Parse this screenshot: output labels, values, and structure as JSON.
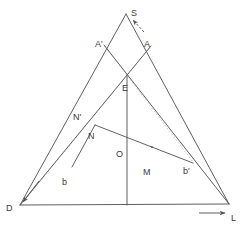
{
  "figure": {
    "title": "",
    "type": "geometric-construction-diagram",
    "background_color": "#ffffff",
    "stroke_color": "#555555",
    "faint_stroke_color": "#bdbdbd",
    "label_color": "#3a3a3a",
    "points": {
      "S": {
        "label": "S",
        "x": 126,
        "y": 13,
        "label_x": 131,
        "label_y": 13
      },
      "A": {
        "label": "A",
        "x": 151,
        "y": 46,
        "label_x": 146,
        "label_y": 44
      },
      "A_prime": {
        "label": "A'",
        "x": 104,
        "y": 45,
        "label_x": 97,
        "label_y": 44
      },
      "E": {
        "label": "E",
        "x": 127,
        "y": 74,
        "label_x": 124,
        "label_y": 88
      },
      "N_prime": {
        "label": "N'",
        "x": 88,
        "y": 117,
        "label_x": 75,
        "label_y": 117
      },
      "N": {
        "label": "N",
        "x": 95,
        "y": 125,
        "label_x": 89,
        "label_y": 136
      },
      "O": {
        "label": "O",
        "x": 127,
        "y": 146,
        "label_x": 118,
        "label_y": 154
      },
      "M": {
        "label": "M",
        "x": 152,
        "y": 160,
        "label_x": 145,
        "label_y": 172
      },
      "b": {
        "label": "b",
        "x": 72,
        "y": 167,
        "label_x": 63,
        "label_y": 182
      },
      "b_prime": {
        "label": "b'",
        "x": 192,
        "y": 162,
        "label_x": 184,
        "label_y": 172
      },
      "D": {
        "label": "D",
        "x": 21,
        "y": 205,
        "label_x": 8,
        "label_y": 208
      },
      "L": {
        "label": "L",
        "x": 228,
        "y": 204,
        "label_x": 232,
        "label_y": 218
      }
    },
    "lines": [
      {
        "name": "baseline-D-L",
        "from": "D",
        "to": "L",
        "style": "solid"
      },
      {
        "name": "edge-S-D",
        "from": "S",
        "to": "D",
        "style": "solid"
      },
      {
        "name": "edge-S-L",
        "from": "S",
        "to": "L",
        "style": "solid"
      },
      {
        "name": "cevian-A-D",
        "from": "A",
        "to": "D",
        "style": "solid"
      },
      {
        "name": "cevian-A-prime-L",
        "from": "A'",
        "to": "L",
        "style": "solid"
      },
      {
        "name": "vertical-E-baseline",
        "from": "E",
        "to": "baseline",
        "style": "solid"
      },
      {
        "name": "segment-N-b",
        "from": "N",
        "to": "b",
        "style": "solid"
      },
      {
        "name": "segment-N-b-prime",
        "from": "N",
        "to": "b'",
        "style": "solid"
      },
      {
        "name": "dotted-D-to-A",
        "from": "D",
        "to": "A",
        "style": "dotted"
      },
      {
        "name": "dotted-A-prime-b-prime",
        "from": "A'",
        "to": "b'",
        "style": "dotted"
      }
    ],
    "arrows": [
      {
        "name": "arrow-to-S",
        "label": "",
        "x1": 143,
        "y1": 31,
        "x2": 132,
        "y2": 19
      },
      {
        "name": "arrow-to-D",
        "label": "",
        "x1": 38,
        "y1": 182,
        "x2": 22,
        "y2": 203
      },
      {
        "name": "arrow-to-L",
        "label": "",
        "x1": 200,
        "y1": 213,
        "x2": 226,
        "y2": 213
      }
    ],
    "labels_order": [
      "S",
      "A'",
      "A",
      "E",
      "N'",
      "N",
      "O",
      "M",
      "b",
      "b'",
      "D",
      "L"
    ]
  }
}
